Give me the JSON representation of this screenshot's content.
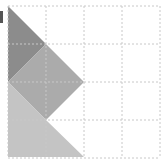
{
  "figure": {
    "type": "tangram-style grid puzzle",
    "grid": {
      "rows": 4,
      "cols": 4,
      "origin": [
        8,
        6
      ],
      "cell_size": 38,
      "line_color": "#c8c8c8",
      "line_style": "dotted"
    },
    "shapes": [
      {
        "name": "dark-triangle",
        "color": "#8c8c8c",
        "points": [
          [
            8,
            6
          ],
          [
            46,
            44
          ],
          [
            8,
            82
          ]
        ]
      },
      {
        "name": "medium-diamond",
        "color": "#ababab",
        "points": [
          [
            46,
            44
          ],
          [
            84,
            82
          ],
          [
            46,
            120
          ],
          [
            8,
            82
          ]
        ]
      },
      {
        "name": "light-quad",
        "color": "#c4c4c4",
        "points": [
          [
            8,
            82
          ],
          [
            46,
            120
          ],
          [
            84,
            157
          ],
          [
            8,
            157
          ]
        ]
      }
    ],
    "edge_mark": {
      "color": "#555555",
      "rect": [
        0,
        11,
        3,
        12
      ]
    }
  }
}
